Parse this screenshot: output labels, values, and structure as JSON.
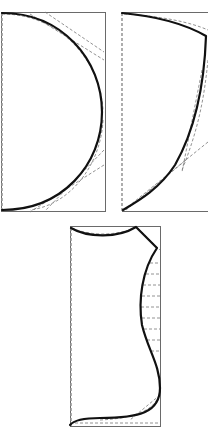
{
  "figure": {
    "panels": [
      {
        "id": "panel-1",
        "shape": "semicircle bulging right",
        "position": "top-left"
      },
      {
        "id": "panel-2",
        "shape": "curved wedge bulging upper-right",
        "position": "top-right"
      },
      {
        "id": "panel-3",
        "shape": "wavy profile with horizontal hatch dashes",
        "position": "bottom-center"
      }
    ],
    "colors": {
      "curve": "#111111",
      "frame": "#6a6a6a",
      "construction": "#777777"
    }
  }
}
